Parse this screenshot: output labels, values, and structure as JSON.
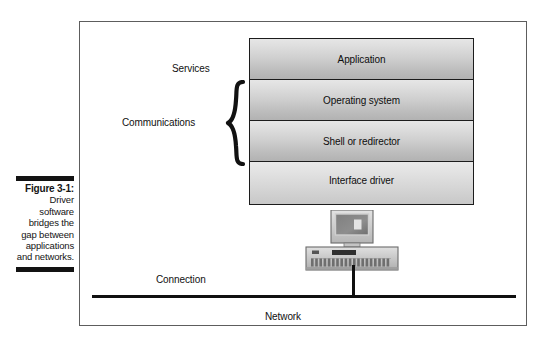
{
  "caption": {
    "figure_label": "Figure 3-1:",
    "body": "Driver software bridges the gap between applications and networks."
  },
  "figure": {
    "side_labels": {
      "services": "Services",
      "communications": "Communications",
      "connection": "Connection",
      "network": "Network"
    },
    "layers": [
      {
        "label": "Application"
      },
      {
        "label": "Operating system"
      },
      {
        "label": "Shell or redirector"
      },
      {
        "label": "Interface driver"
      }
    ],
    "brace_icon": "curly-brace-icon",
    "computer_icon": "desktop-computer-icon"
  },
  "colors": {
    "frame_border": "#5d5d5d",
    "box_border": "#1c1c1c",
    "box_gradient_top": "#e6e6e6",
    "box_gradient_bottom": "#b2b2b2",
    "line_black": "#101010",
    "caption_rule": "#131313"
  }
}
